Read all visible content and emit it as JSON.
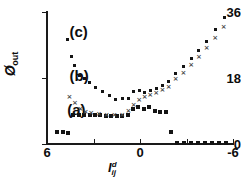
{
  "chart_data": {
    "type": "scatter",
    "title": "",
    "subtitle": "",
    "xlabel": "I",
    "xlabel_sup": "d",
    "xlabel_sub": "ij",
    "ylabel": "Ø",
    "ylabel_sub": "out",
    "xlim": [
      6,
      -6
    ],
    "ylim": [
      0,
      36
    ],
    "x_ticks": [
      6,
      3,
      0,
      -3,
      -6
    ],
    "x_tick_labels": [
      "6",
      "",
      "0",
      "",
      "-6"
    ],
    "y_ticks": [
      0,
      18,
      36
    ],
    "y_tick_labels": [
      "0",
      "18",
      "36"
    ],
    "grid": false,
    "legend_position": "inline-annotations",
    "annotations": [
      {
        "text": "(c)",
        "x": 4.55,
        "y": 30.5
      },
      {
        "text": "(b)",
        "x": 4.55,
        "y": 18.6
      },
      {
        "text": "(a)",
        "x": 4.7,
        "y": 9.2
      }
    ],
    "series": [
      {
        "name": "(a)",
        "marker": "filled-square",
        "marker_size": 4,
        "color": "#141414",
        "points": [
          [
            5.35,
            3.3
          ],
          [
            5.0,
            3.4
          ],
          [
            4.65,
            2.9
          ],
          [
            4.3,
            7.9
          ],
          [
            3.95,
            8.0
          ],
          [
            3.6,
            7.9
          ],
          [
            3.25,
            7.9
          ],
          [
            2.9,
            7.9
          ],
          [
            2.55,
            7.9
          ],
          [
            2.2,
            7.7
          ],
          [
            1.85,
            7.6
          ],
          [
            1.5,
            7.6
          ],
          [
            1.15,
            7.6
          ],
          [
            0.8,
            7.9
          ],
          [
            0.45,
            9.6
          ],
          [
            0.1,
            10.2
          ],
          [
            -0.25,
            9.6
          ],
          [
            -0.6,
            10.0
          ],
          [
            -0.95,
            9.0
          ],
          [
            -1.3,
            8.7
          ],
          [
            -1.65,
            8.6
          ],
          [
            -2.0,
            3.4
          ],
          [
            -2.4,
            0.3
          ],
          [
            -2.85,
            0.3
          ],
          [
            -3.3,
            0.3
          ],
          [
            -3.75,
            0.3
          ],
          [
            -4.2,
            0.3
          ],
          [
            -4.65,
            0.3
          ],
          [
            -5.1,
            0.3
          ],
          [
            -5.55,
            0.3
          ]
        ]
      },
      {
        "name": "(b)",
        "marker": "x-cross",
        "marker_size": 4,
        "color": "#4a4a4a",
        "points": [
          [
            4.55,
            12.8
          ],
          [
            4.2,
            11.0
          ],
          [
            3.85,
            9.5
          ],
          [
            3.5,
            8.5
          ],
          [
            3.15,
            8.2
          ],
          [
            2.65,
            8.0
          ],
          [
            2.15,
            7.9
          ],
          [
            1.65,
            7.9
          ],
          [
            1.15,
            7.8
          ],
          [
            0.75,
            8.9
          ],
          [
            0.4,
            10.5
          ],
          [
            0.05,
            12.0
          ],
          [
            -0.3,
            12.6
          ],
          [
            -0.65,
            13.2
          ],
          [
            -1.05,
            13.9
          ],
          [
            -1.45,
            14.5
          ],
          [
            -1.85,
            15.4
          ],
          [
            -2.3,
            17.5
          ],
          [
            -2.8,
            19.3
          ],
          [
            -3.3,
            21.3
          ],
          [
            -3.8,
            23.6
          ],
          [
            -4.3,
            26.0
          ],
          [
            -4.85,
            28.9
          ],
          [
            -5.4,
            31.8
          ]
        ]
      },
      {
        "name": "(c)",
        "marker": "filled-square",
        "marker_size": 3,
        "color": "#141414",
        "points": [
          [
            4.7,
            28.6
          ],
          [
            4.45,
            24.0
          ],
          [
            4.2,
            21.4
          ],
          [
            3.9,
            18.8
          ],
          [
            3.6,
            18.0
          ],
          [
            3.25,
            16.8
          ],
          [
            2.85,
            15.4
          ],
          [
            2.45,
            14.2
          ],
          [
            2.0,
            13.1
          ],
          [
            1.55,
            12.1
          ],
          [
            1.15,
            12.3
          ],
          [
            0.75,
            12.5
          ],
          [
            0.4,
            14.3
          ],
          [
            0.05,
            14.6
          ],
          [
            -0.3,
            14.0
          ],
          [
            -0.65,
            14.7
          ],
          [
            -1.05,
            15.2
          ],
          [
            -1.45,
            16.0
          ],
          [
            -1.85,
            17.1
          ],
          [
            -2.3,
            19.3
          ],
          [
            -2.8,
            21.2
          ],
          [
            -3.3,
            23.2
          ],
          [
            -3.8,
            25.5
          ],
          [
            -4.3,
            28.0
          ],
          [
            -4.85,
            31.2
          ],
          [
            -5.45,
            34.4
          ]
        ]
      }
    ]
  }
}
